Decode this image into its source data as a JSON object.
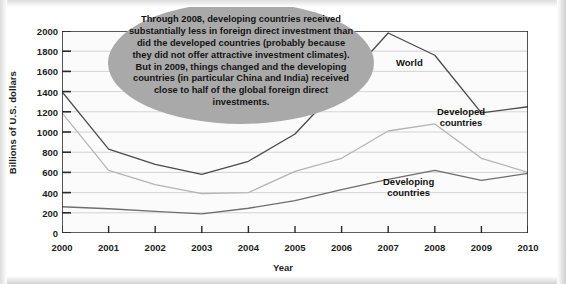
{
  "chart_data": {
    "type": "line",
    "title": "",
    "xlabel": "Year",
    "ylabel": "Billions of U.S. dollars",
    "x": [
      2000,
      2001,
      2002,
      2003,
      2004,
      2005,
      2006,
      2007,
      2008,
      2009,
      2010
    ],
    "xtick_labels": [
      "2000",
      "2001",
      "2002",
      "2003",
      "2004",
      "2005",
      "2006",
      "2007",
      "2008",
      "2009",
      "2010"
    ],
    "ytick_labels": [
      "0",
      "200",
      "400",
      "600",
      "800",
      "1000",
      "1200",
      "1400",
      "1600",
      "1800",
      "2000"
    ],
    "ytick_values": [
      0,
      200,
      400,
      600,
      800,
      1000,
      1200,
      1400,
      1600,
      1800,
      2000
    ],
    "xlim": [
      2000,
      2010
    ],
    "ylim": [
      0,
      2000
    ],
    "grid": true,
    "legend_position": "inline-labels",
    "series": [
      {
        "name": "World",
        "color": "#4a4a4a",
        "values": [
          1400,
          830,
          680,
          580,
          710,
          980,
          1470,
          1980,
          1760,
          1190,
          1250
        ]
      },
      {
        "name": "Developed countries",
        "color": "#b4b4b4",
        "values": [
          1190,
          620,
          480,
          390,
          400,
          610,
          740,
          1010,
          1080,
          740,
          600
        ]
      },
      {
        "name": "Developing countries",
        "color": "#6e6e6e",
        "values": [
          260,
          240,
          215,
          190,
          245,
          320,
          430,
          530,
          620,
          520,
          590
        ]
      }
    ]
  },
  "callout": {
    "text": "Through 2008, developing countries received substantially less in foreign direct investment than did the developed countries (probably because they did not offer attractive investment climates).  But in 2009, things changed and the developing countries (in particular China and India) received close to half of the global foreign direct investments.",
    "background_color": "#a9a9a9"
  },
  "series_labels": {
    "world": "World",
    "developed": "Developed\ncountries",
    "developing": "Developing\ncountries"
  }
}
